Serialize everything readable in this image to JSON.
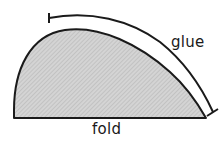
{
  "diagram": {
    "labels": {
      "glue": "glue",
      "fold": "fold"
    },
    "colors": {
      "stroke": "#1a1a1a",
      "fill": "#c8c8c8",
      "background": "#ffffff"
    }
  }
}
